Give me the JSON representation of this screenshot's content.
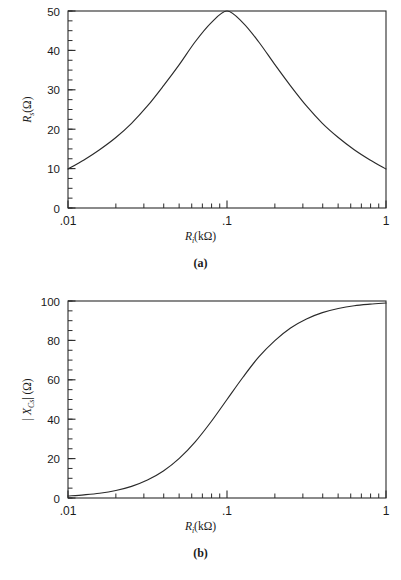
{
  "figure": {
    "panels": [
      {
        "id": "a",
        "caption": "(a)",
        "xlabel_main": "R",
        "xlabel_sub": "i",
        "xlabel_unit": "(kΩ)",
        "ylabel_main": "R",
        "ylabel_sub": "s",
        "ylabel_unit": "(Ω)",
        "ytick_labels": [
          "50",
          "40",
          "30",
          "20",
          "10",
          "0"
        ],
        "xtick_labels": [
          ".01",
          ".1",
          "1"
        ]
      },
      {
        "id": "b",
        "caption": "(b)",
        "xlabel_main": "R",
        "xlabel_sub": "i",
        "xlabel_unit": "(kΩ)",
        "ylabel_main": "| X",
        "ylabel_sub": "Cs",
        "ylabel_unit": "| (Ω)",
        "ytick_labels": [
          "100",
          "80",
          "60",
          "40",
          "20",
          "0"
        ],
        "xtick_labels": [
          ".01",
          ".1",
          "1"
        ]
      }
    ]
  },
  "chart_data": [
    {
      "type": "line",
      "title": "",
      "panel": "a",
      "xlabel": "R_i(kΩ)",
      "ylabel": "R_s(Ω)",
      "xscale": "log",
      "xlim": [
        0.01,
        1
      ],
      "ylim": [
        0,
        50
      ],
      "xticks": [
        0.01,
        0.1,
        1
      ],
      "xticklabels": [
        ".01",
        ".1",
        "1"
      ],
      "yticks": [
        0,
        10,
        20,
        30,
        40,
        50
      ],
      "yticklabels": [
        "0",
        "10",
        "20",
        "30",
        "40",
        "50"
      ],
      "yminor_step": 2.5,
      "grid": false,
      "legend": null,
      "series": [
        {
          "name": "Rs",
          "x": [
            0.01,
            0.0126,
            0.0158,
            0.02,
            0.0251,
            0.0316,
            0.0398,
            0.0501,
            0.0631,
            0.0794,
            0.1,
            0.126,
            0.158,
            0.2,
            0.251,
            0.316,
            0.398,
            0.501,
            0.631,
            0.794,
            1.0
          ],
          "values": [
            9.9,
            12.2,
            14.8,
            17.9,
            21.5,
            25.9,
            31.0,
            36.4,
            42.2,
            47.0,
            50.0,
            47.0,
            42.2,
            36.4,
            31.0,
            25.9,
            21.5,
            17.9,
            14.8,
            12.2,
            9.9
          ]
        }
      ]
    },
    {
      "type": "line",
      "title": "",
      "panel": "b",
      "xlabel": "R_i(kΩ)",
      "ylabel": "| X_Cs | (Ω)",
      "xscale": "log",
      "xlim": [
        0.01,
        1
      ],
      "ylim": [
        0,
        100
      ],
      "xticks": [
        0.01,
        0.1,
        1
      ],
      "xticklabels": [
        ".01",
        ".1",
        "1"
      ],
      "yticks": [
        0,
        20,
        40,
        60,
        80,
        100
      ],
      "yticklabels": [
        "0",
        "20",
        "40",
        "60",
        "80",
        "100"
      ],
      "yminor_step": 5,
      "grid": false,
      "legend": null,
      "series": [
        {
          "name": "XCs",
          "x": [
            0.01,
            0.0126,
            0.0158,
            0.02,
            0.0251,
            0.0316,
            0.0398,
            0.0501,
            0.0631,
            0.0794,
            0.1,
            0.126,
            0.158,
            0.2,
            0.251,
            0.316,
            0.398,
            0.501,
            0.631,
            0.794,
            1.0
          ],
          "values": [
            1.0,
            1.6,
            2.4,
            3.8,
            5.9,
            9.1,
            13.7,
            20.1,
            28.5,
            38.7,
            50.0,
            61.3,
            71.5,
            79.9,
            86.3,
            90.9,
            94.1,
            96.2,
            97.6,
            98.4,
            99.0
          ]
        }
      ]
    }
  ]
}
